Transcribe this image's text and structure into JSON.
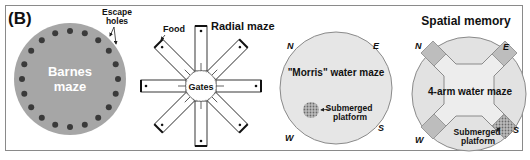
{
  "figure": {
    "panel_label": "(B)",
    "section_title": "Spatial memory"
  },
  "barnes_maze": {
    "title_line1": "Barnes",
    "title_line2": "maze",
    "annotation_line1": "Escape",
    "annotation_line2": "holes",
    "disk_color": "#a6a6a6",
    "hole_color": "#3a3a3a"
  },
  "radial_maze": {
    "title": "Radial maze",
    "food_label": "Food",
    "center_label": "Gates",
    "arm_count": 8
  },
  "morris_water_maze": {
    "title": "\"Morris\" water maze",
    "platform_label_line1": "Submerged",
    "platform_label_line2": "platform",
    "directions": {
      "n": "N",
      "e": "E",
      "s": "S",
      "w": "W"
    },
    "pool_color": "#e6e6e6"
  },
  "four_arm_water_maze": {
    "title": "4-arm water maze",
    "platform_label_line1": "Submerged",
    "platform_label_line2": "platform",
    "directions": {
      "n": "N",
      "e": "E",
      "s": "S",
      "w": "W"
    },
    "pool_color": "#e2e2e2",
    "arm_end_color": "#bdbdbd"
  }
}
